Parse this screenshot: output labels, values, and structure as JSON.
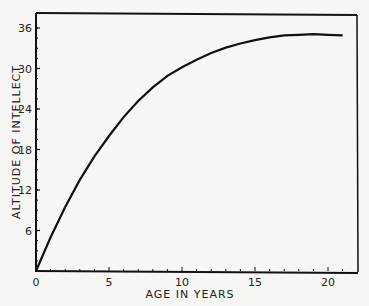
{
  "chart_data": {
    "type": "line",
    "title": "",
    "xlabel": "AGE IN YEARS",
    "ylabel": "ALTITUDE OF INTELLECT",
    "xlim": [
      0,
      21.5
    ],
    "ylim": [
      0,
      38
    ],
    "grid": false,
    "x_ticks": [
      "0",
      "5",
      "10",
      "15",
      "20"
    ],
    "y_ticks": [
      "6",
      "12",
      "18",
      "24",
      "30",
      "36"
    ],
    "series": [
      {
        "name": "Altitude of intellect",
        "x": [
          0,
          1,
          2,
          3,
          4,
          5,
          6,
          7,
          8,
          9,
          10,
          11,
          12,
          13,
          14,
          15,
          16,
          17,
          18,
          19,
          20,
          21
        ],
        "values": [
          0,
          5,
          9.5,
          13.5,
          17,
          20,
          22.8,
          25.2,
          27.2,
          28.9,
          30.2,
          31.3,
          32.3,
          33.1,
          33.7,
          34.2,
          34.6,
          34.9,
          35.0,
          35.1,
          35.0,
          34.9
        ]
      }
    ]
  }
}
